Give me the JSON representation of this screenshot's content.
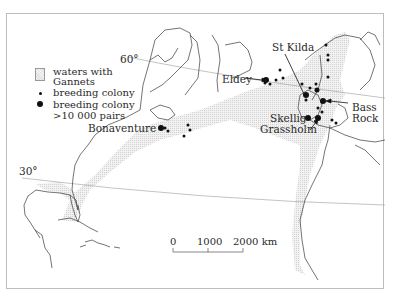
{
  "map": {
    "title": "North Atlantic Gannet distribution",
    "latitude_labels": [
      {
        "label": "60°",
        "x": 120,
        "y": 57
      },
      {
        "label": "30°",
        "x": 19,
        "y": 168
      }
    ],
    "legend": {
      "waters_label_1": "waters with",
      "waters_label_2": "Gannets",
      "small_colony_label": "breeding colony",
      "large_colony_label_1": "breeding colony",
      "large_colony_label_2": ">10 000 pairs"
    },
    "place_labels": [
      {
        "name": "Bonaventure",
        "x": 88,
        "y": 126
      },
      {
        "name": "Eldey",
        "x": 222,
        "y": 69
      },
      {
        "name": "St Kilda",
        "x": 272,
        "y": 43
      },
      {
        "name": "Bass",
        "x": 352,
        "y": 103
      },
      {
        "name": "Rock",
        "x": 352,
        "y": 114
      },
      {
        "name": "Skellig",
        "x": 270,
        "y": 113
      },
      {
        "name": "Grassholm",
        "x": 260,
        "y": 124
      }
    ],
    "scale_bar": {
      "tick_labels": [
        "0",
        "1000",
        "2000 km"
      ]
    },
    "colors": {
      "coastline": "#3a3a3a",
      "water_shade": "#e6e6e6",
      "colony": "#111111",
      "frame": "#bdbdbd"
    }
  }
}
